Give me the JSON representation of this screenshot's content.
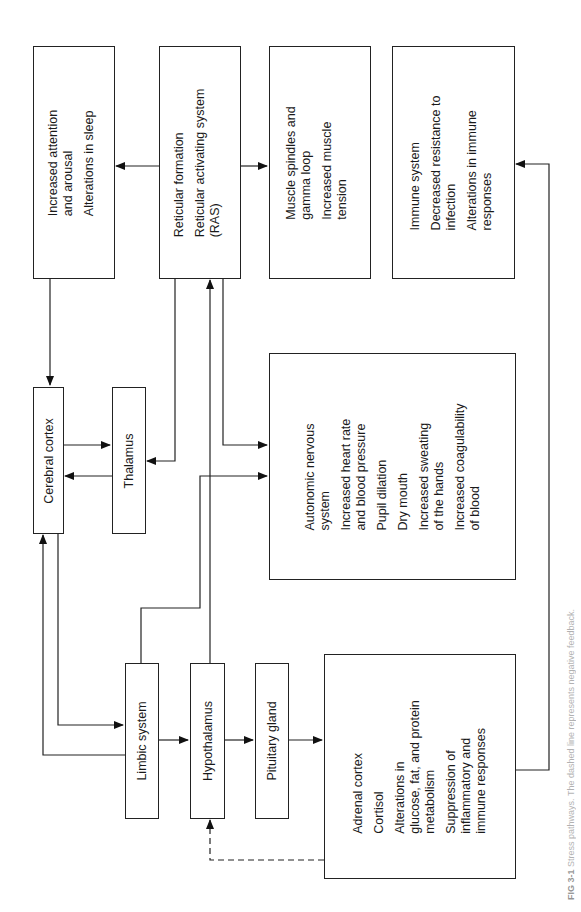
{
  "figure": {
    "caption_label": "FIG 3-1",
    "caption_text": "Stress pathways. The dashed line represents negative feedback."
  },
  "nodes": {
    "attention": {
      "lines": [
        "Increased attention\nand arousal",
        "Alterations in sleep"
      ]
    },
    "reticular": {
      "lines": [
        "Reticular formation",
        "Reticular activating system\n(RAS)"
      ]
    },
    "muscle": {
      "lines": [
        "Muscle spindles and\ngamma loop",
        "Increased muscle\ntension"
      ]
    },
    "immune": {
      "lines": [
        "Immune system",
        "Decreased resistance to\ninfection",
        "Alterations in immune\nresponses"
      ]
    },
    "cortex": {
      "lines": [
        "Cerebral cortex"
      ]
    },
    "thalamus": {
      "lines": [
        "Thalamus"
      ]
    },
    "autonomic": {
      "lines": [
        "Autonomic nervous\nsystem",
        "Increased heart rate\nand blood pressure",
        "Pupil dilation",
        "Dry mouth",
        "Increased sweating\nof the hands",
        "Increased coagulability\nof blood"
      ]
    },
    "limbic": {
      "lines": [
        "Limbic system"
      ]
    },
    "hypothalamus": {
      "lines": [
        "Hypothalamus"
      ]
    },
    "pituitary": {
      "lines": [
        "Pituitary gland"
      ]
    },
    "adrenal": {
      "lines": [
        "Adrenal cortex",
        "Cortisol",
        "Alterations in\nglucose, fat, and protein\nmetabolism",
        "Suppression of\ninflammatory and\nimmune responses"
      ]
    }
  },
  "edges": [
    {
      "from": "reticular",
      "to": "attention",
      "style": "solid"
    },
    {
      "from": "reticular",
      "to": "muscle",
      "style": "solid"
    },
    {
      "from": "attention",
      "to": "cortex",
      "style": "solid"
    },
    {
      "from": "reticular",
      "to": "thalamus",
      "style": "solid"
    },
    {
      "from": "reticular",
      "to": "autonomic",
      "style": "solid"
    },
    {
      "from": "hypothalamus",
      "to": "reticular",
      "style": "solid"
    },
    {
      "from": "cortex",
      "to": "thalamus",
      "style": "solid"
    },
    {
      "from": "thalamus",
      "to": "cortex",
      "style": "solid"
    },
    {
      "from": "limbic",
      "to": "cortex",
      "style": "solid"
    },
    {
      "from": "cortex",
      "to": "limbic",
      "style": "solid"
    },
    {
      "from": "limbic",
      "to": "autonomic",
      "style": "solid"
    },
    {
      "from": "limbic",
      "to": "hypothalamus",
      "style": "solid"
    },
    {
      "from": "hypothalamus",
      "to": "pituitary",
      "style": "solid"
    },
    {
      "from": "pituitary",
      "to": "adrenal",
      "style": "solid"
    },
    {
      "from": "adrenal",
      "to": "immune",
      "style": "solid"
    },
    {
      "from": "adrenal",
      "to": "hypothalamus",
      "style": "dashed"
    }
  ]
}
